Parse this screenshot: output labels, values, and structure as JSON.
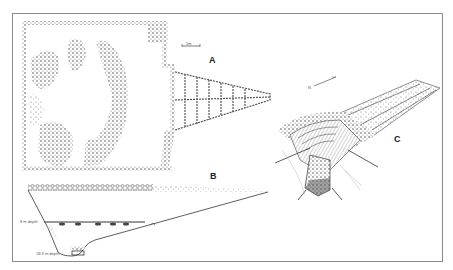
{
  "figure": {
    "panels": [
      {
        "id": "A",
        "label": "A",
        "description": "plan view"
      },
      {
        "id": "B",
        "label": "B",
        "description": "section profile"
      },
      {
        "id": "C",
        "label": "C",
        "description": "isometric reconstruction"
      }
    ],
    "depth_labels": {
      "upper": "8 m depth",
      "lower": "18.3 m depth"
    },
    "scale_bar_label": "5m",
    "north_arrow_label": "N",
    "colors": {
      "ink": "#333333",
      "frame": "#8a8a8a",
      "background": "#ffffff"
    }
  }
}
